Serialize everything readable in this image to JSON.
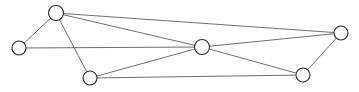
{
  "figure": {
    "width": 359,
    "height": 92,
    "background_color": "#ffffff"
  },
  "style": {
    "edge_color": "#4a4a4a",
    "edge_width": 0.8,
    "node_fill": "#ffffff",
    "node_stroke": "#2b2b2b",
    "node_stroke_width": 1.1,
    "node_radius": 7
  },
  "graph": {
    "node_count": 6,
    "edge_count": 10,
    "nodes": [
      {
        "id": "n0",
        "name": "far-left-node",
        "cx": 19,
        "cy": 48,
        "r": 7
      },
      {
        "id": "n1",
        "name": "top-left-node",
        "cx": 56,
        "cy": 13,
        "r": 7.5
      },
      {
        "id": "n2",
        "name": "bottom-left-node",
        "cx": 90,
        "cy": 78,
        "r": 7
      },
      {
        "id": "n3",
        "name": "center-hub-node",
        "cx": 202,
        "cy": 47,
        "r": 7.5
      },
      {
        "id": "n4",
        "name": "top-right-node",
        "cx": 341,
        "cy": 33,
        "r": 7
      },
      {
        "id": "n5",
        "name": "bottom-right-node",
        "cx": 303,
        "cy": 75,
        "r": 7
      }
    ],
    "edges": [
      {
        "id": "e0",
        "from": "n0",
        "to": "n1",
        "x1": 19,
        "y1": 48,
        "x2": 56,
        "y2": 13
      },
      {
        "id": "e1",
        "from": "n0",
        "to": "n3",
        "x1": 19,
        "y1": 48,
        "x2": 202,
        "y2": 47
      },
      {
        "id": "e2",
        "from": "n1",
        "to": "n2",
        "x1": 56,
        "y1": 13,
        "x2": 90,
        "y2": 78
      },
      {
        "id": "e3",
        "from": "n1",
        "to": "n3",
        "x1": 56,
        "y1": 13,
        "x2": 202,
        "y2": 47
      },
      {
        "id": "e4",
        "from": "n1",
        "to": "n4",
        "x1": 56,
        "y1": 13,
        "x2": 341,
        "y2": 33
      },
      {
        "id": "e5",
        "from": "n2",
        "to": "n3",
        "x1": 90,
        "y1": 78,
        "x2": 202,
        "y2": 47
      },
      {
        "id": "e6",
        "from": "n2",
        "to": "n5",
        "x1": 90,
        "y1": 78,
        "x2": 303,
        "y2": 75
      },
      {
        "id": "e7",
        "from": "n3",
        "to": "n4",
        "x1": 202,
        "y1": 47,
        "x2": 341,
        "y2": 33
      },
      {
        "id": "e8",
        "from": "n3",
        "to": "n5",
        "x1": 202,
        "y1": 47,
        "x2": 303,
        "y2": 75
      },
      {
        "id": "e9",
        "from": "n4",
        "to": "n5",
        "x1": 341,
        "y1": 33,
        "x2": 303,
        "y2": 75
      }
    ]
  }
}
